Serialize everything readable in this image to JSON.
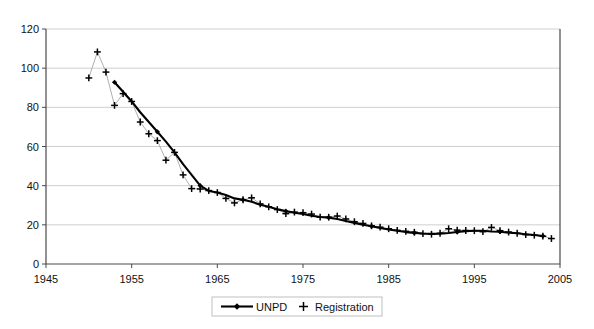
{
  "chart_data": {
    "type": "line",
    "title": "",
    "subtitle": "",
    "xlabel": "",
    "ylabel": "",
    "xlim": [
      1945,
      2005
    ],
    "ylim": [
      0,
      120
    ],
    "grid": true,
    "legend_position": "bottom",
    "x_ticks": [
      "1945",
      "1955",
      "1965",
      "1975",
      "1985",
      "1995",
      "2005"
    ],
    "x_tick_values": [
      1945,
      1955,
      1965,
      1975,
      1985,
      1995,
      2005
    ],
    "y_ticks": [
      "0",
      "20",
      "40",
      "60",
      "80",
      "100",
      "120"
    ],
    "y_tick_values": [
      0,
      20,
      40,
      60,
      80,
      100,
      120
    ],
    "series": [
      {
        "name": "UNPD",
        "marker": "diamond",
        "line": true,
        "color": "#000000",
        "x": [
          1953,
          1954,
          1955,
          1956,
          1957,
          1958,
          1959,
          1960,
          1961,
          1962,
          1963,
          1964,
          1965,
          1966,
          1967,
          1968,
          1969,
          1970,
          1971,
          1972,
          1973,
          1974,
          1975,
          1976,
          1977,
          1978,
          1979,
          1980,
          1981,
          1982,
          1983,
          1984,
          1985,
          1986,
          1987,
          1988,
          1989,
          1990,
          1991,
          1992,
          1993,
          1994,
          1995,
          1996,
          1997,
          1998,
          1999,
          2000,
          2001,
          2002,
          2003
        ],
        "values": [
          92.8,
          88.0,
          83.0,
          77.5,
          72.5,
          67.5,
          62.5,
          57.0,
          51.0,
          45.5,
          40.0,
          37.3,
          36.5,
          35.2,
          33.5,
          32.8,
          31.8,
          30.3,
          29.2,
          28.0,
          27.0,
          26.2,
          25.5,
          24.6,
          24.0,
          23.7,
          23.0,
          22.0,
          21.0,
          20.0,
          19.3,
          18.4,
          17.6,
          17.0,
          16.3,
          15.9,
          15.6,
          15.4,
          15.5,
          15.8,
          16.3,
          16.8,
          17.0,
          17.0,
          16.6,
          16.5,
          16.0,
          15.7,
          15.2,
          14.8,
          14.3
        ]
      },
      {
        "name": "Registration",
        "marker": "plus",
        "line": true,
        "color": "#9a9a9a",
        "x": [
          1950,
          1951,
          1952,
          1953,
          1954,
          1955,
          1956,
          1957,
          1958,
          1959,
          1960,
          1961,
          1962,
          1963,
          1964,
          1965,
          1966,
          1967,
          1968,
          1969,
          1970,
          1971,
          1972,
          1973,
          1974,
          1975,
          1976,
          1977,
          1978,
          1979,
          1980,
          1981,
          1982,
          1983,
          1984,
          1985,
          1986,
          1987,
          1988,
          1989,
          1990,
          1991,
          1992,
          1993,
          1994,
          1995,
          1996,
          1997,
          1998,
          1999,
          2000,
          2001,
          2002,
          2003,
          2004
        ],
        "values": [
          95.0,
          108.3,
          98.0,
          81.0,
          87.0,
          83.0,
          72.5,
          66.5,
          63.0,
          53.0,
          57.0,
          45.5,
          38.5,
          38.3,
          37.5,
          36.5,
          33.5,
          31.2,
          32.8,
          33.8,
          30.7,
          29.2,
          27.8,
          25.7,
          26.5,
          26.2,
          25.5,
          23.9,
          23.9,
          24.5,
          23.0,
          21.6,
          20.7,
          19.5,
          18.8,
          18.0,
          17.2,
          16.7,
          16.2,
          15.5,
          15.2,
          15.7,
          18.0,
          17.3,
          17.1,
          17.0,
          16.5,
          18.7,
          17.0,
          16.3,
          15.7,
          15.0,
          14.7,
          14.2,
          13.0
        ]
      }
    ]
  },
  "legend": {
    "items": [
      {
        "label": "UNPD",
        "icon": "line-diamond-marker"
      },
      {
        "label": "Registration",
        "icon": "plus-marker"
      }
    ]
  },
  "colors": {
    "unpd_line": "#000000",
    "registration_line": "#9a9a9a",
    "gridline": "#c9c9c9",
    "axis": "#4a4a4a",
    "background": "#ffffff",
    "text": "#111111"
  }
}
